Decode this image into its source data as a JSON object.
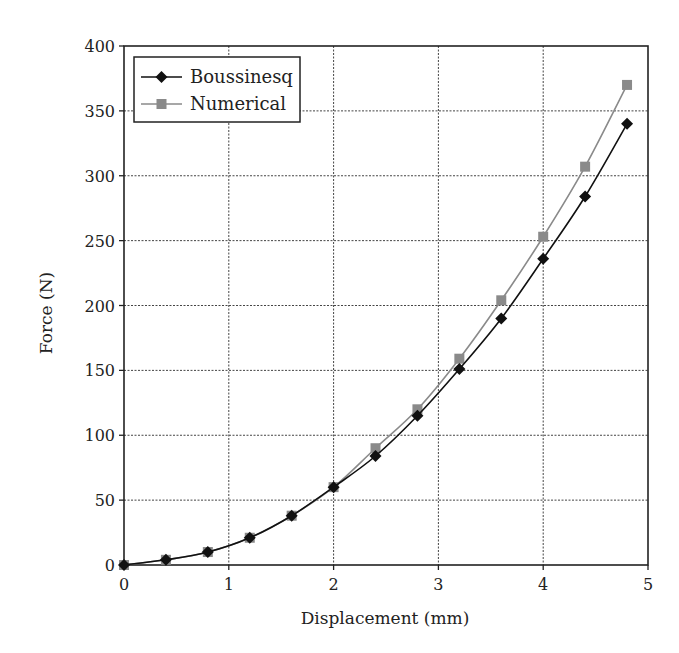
{
  "chart_data": {
    "type": "line",
    "title": "",
    "xlabel": "Displacement (mm)",
    "ylabel": "Force (N)",
    "xlim": [
      0,
      5
    ],
    "ylim": [
      0,
      400
    ],
    "xticks": [
      0,
      1,
      2,
      3,
      4,
      5
    ],
    "yticks": [
      0,
      50,
      100,
      150,
      200,
      250,
      300,
      350,
      400
    ],
    "grid": true,
    "legend_position": "upper left",
    "x": [
      0,
      0.4,
      0.8,
      1.2,
      1.6,
      2.0,
      2.4,
      2.8,
      3.2,
      3.6,
      4.0,
      4.4,
      4.8
    ],
    "series": [
      {
        "name": "Boussinesq",
        "marker": "diamond",
        "color": "#111111",
        "values": [
          0,
          4,
          10,
          21,
          38,
          60,
          84,
          115,
          151,
          190,
          236,
          284,
          340
        ]
      },
      {
        "name": "Numerical",
        "marker": "square",
        "color": "#8a8a8a",
        "values": [
          0,
          4,
          10,
          21,
          38,
          60,
          90,
          120,
          159,
          204,
          253,
          307,
          370
        ]
      }
    ]
  },
  "legend": {
    "items": [
      {
        "label": "Boussinesq"
      },
      {
        "label": "Numerical"
      }
    ]
  }
}
